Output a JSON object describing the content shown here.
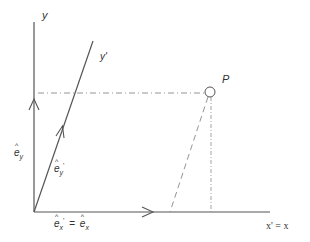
{
  "diagram": {
    "colors": {
      "axis": "#555555",
      "text": "#333333",
      "construction": "#888888"
    },
    "labels": {
      "y_axis": "y",
      "y_prime_axis": "y'",
      "x_axis": "x' = x",
      "point": "P",
      "e_y_base": "e",
      "e_y_sub": "y",
      "e_y_prime_base": "e",
      "e_y_prime_sub": "y",
      "e_y_prime_mark": "'",
      "e_x_prime_base": "e",
      "e_x_prime_sub": "x",
      "e_x_prime_mark": "'",
      "equals": "=",
      "e_x_base": "e",
      "e_x_sub": "x"
    },
    "geometry": {
      "origin": [
        34,
        212
      ],
      "y_axis_end": [
        34,
        22
      ],
      "y_prime_axis_end": [
        93,
        41
      ],
      "x_axis_end": [
        270,
        212
      ],
      "point_P": [
        210,
        92
      ],
      "point_P_radius": 5
    },
    "icons": {
      "point_marker": "open-circle",
      "arrowheads": "open-chevron"
    }
  }
}
